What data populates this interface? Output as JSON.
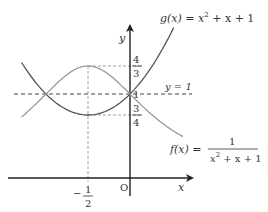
{
  "chart_data": {
    "type": "line",
    "title": "",
    "xlabel": "x",
    "ylabel": "y",
    "origin_label": "O",
    "series": [
      {
        "name": "g(x) = x^2 + x + 1",
        "label_parts": {
          "lhs": "g(x) = x",
          "exp": "2",
          "rhs": " + x + 1"
        },
        "color": "#555555",
        "expression": "x^2+x+1",
        "x_range": [
          -1.29,
          0.52
        ]
      },
      {
        "name": "f(x) = 1/(x^2 + x + 1)",
        "label_parts": {
          "lhs": "f(x) =",
          "num": "1",
          "den_a": "x",
          "den_exp": "2",
          "den_b": " + x + 1"
        },
        "color": "#9a9a9a",
        "expression": "1/(x^2+x+1)",
        "x_range": [
          -1.29,
          0.63
        ]
      }
    ],
    "reference_lines": [
      {
        "type": "horizontal",
        "y": 1,
        "label": "y = 1",
        "style": "dashed"
      },
      {
        "type": "horizontal",
        "y": 1.3333,
        "label": "4/3",
        "style": "dashed",
        "from_x": -0.5,
        "to_x": 0
      },
      {
        "type": "horizontal",
        "y": 0.75,
        "label": "3/4",
        "style": "dashed",
        "from_x": -0.5,
        "to_x": 0
      },
      {
        "type": "vertical",
        "x": -0.5,
        "label": "-1/2",
        "style": "dashed"
      }
    ],
    "tick_labels": {
      "y": [
        {
          "value": 1.3333,
          "num": "4",
          "den": "3"
        },
        {
          "value": 1,
          "text": "1"
        },
        {
          "value": 0.75,
          "num": "3",
          "den": "4"
        }
      ],
      "x": [
        {
          "value": -0.5,
          "sign": "−",
          "num": "1",
          "den": "2"
        }
      ]
    },
    "key_points": [
      {
        "x": -1,
        "y": 1,
        "note": "intersection"
      },
      {
        "x": 0,
        "y": 1,
        "note": "intersection"
      },
      {
        "x": -0.5,
        "y": 1.3333,
        "note": "max of f"
      },
      {
        "x": -0.5,
        "y": 0.75,
        "note": "min of g"
      }
    ]
  }
}
